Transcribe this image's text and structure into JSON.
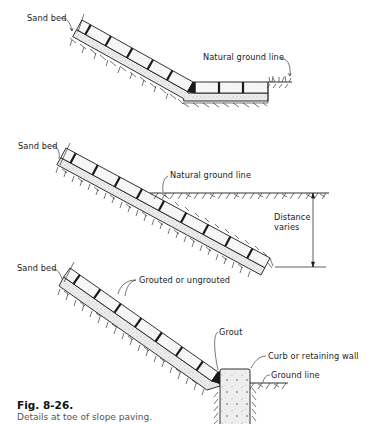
{
  "figure": {
    "number": "Fig. 8-26.",
    "caption": "Details at toe of slope paving."
  },
  "details": [
    {
      "id": "detail-1",
      "labels": {
        "sand_bed": "Sand bed",
        "natural_ground_line": "Natural ground line"
      }
    },
    {
      "id": "detail-2",
      "labels": {
        "sand_bed": "Sand bed",
        "natural_ground_line": "Natural ground line",
        "distance_line1": "Distance",
        "distance_line2": "varies"
      }
    },
    {
      "id": "detail-3",
      "labels": {
        "sand_bed": "Sand bed",
        "grouted": "Grouted or ungrouted",
        "grout": "Grout",
        "curb": "Curb or retaining wall",
        "ground_line": "Ground line"
      }
    }
  ],
  "colors": {
    "line": "#1a1a1a",
    "sand": "#e6e6e6",
    "block": "#f6f6f6",
    "caption_text": "#555555"
  }
}
